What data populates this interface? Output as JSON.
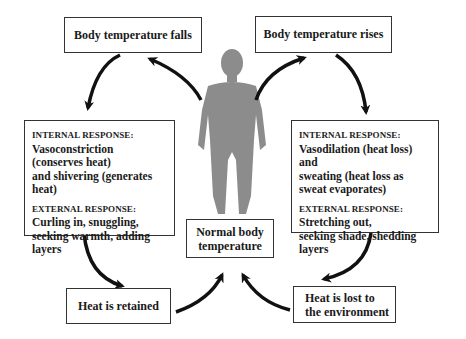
{
  "diagram": {
    "nodes": {
      "falls": {
        "label": "Body temperature falls"
      },
      "rises": {
        "label": "Body temperature rises"
      },
      "normal": {
        "line1": "Normal body",
        "line2": "temperature"
      },
      "retained": {
        "label": "Heat is retained"
      },
      "lost": {
        "line1": "Heat is lost to",
        "line2": "the environment"
      },
      "cold_response": {
        "internal_heading": "INTERNAL RESPONSE:",
        "internal_lines": [
          "Vasoconstriction",
          "(conserves heat)",
          "and shivering (generates heat)"
        ],
        "external_heading": "EXTERNAL RESPONSE:",
        "external_lines": [
          "Curling in, snuggling,",
          "seeking warmth, adding layers"
        ]
      },
      "heat_response": {
        "internal_heading": "INTERNAL RESPONSE:",
        "internal_lines": [
          "Vasodilation (heat loss) and",
          "sweating (heat loss as",
          "sweat evaporates)"
        ],
        "external_heading": "EXTERNAL RESPONSE:",
        "external_lines": [
          "Stretching out,",
          "seeking shade, shedding layers"
        ]
      }
    },
    "figure": {
      "icon": "human-body-silhouette",
      "color": "#8c8c8c"
    },
    "arrow_color": "#111111",
    "edges": [
      [
        "human-figure",
        "falls"
      ],
      [
        "falls",
        "cold_response"
      ],
      [
        "cold_response",
        "retained"
      ],
      [
        "retained",
        "normal"
      ],
      [
        "human-figure",
        "rises"
      ],
      [
        "rises",
        "heat_response"
      ],
      [
        "heat_response",
        "lost"
      ],
      [
        "lost",
        "normal"
      ]
    ]
  }
}
